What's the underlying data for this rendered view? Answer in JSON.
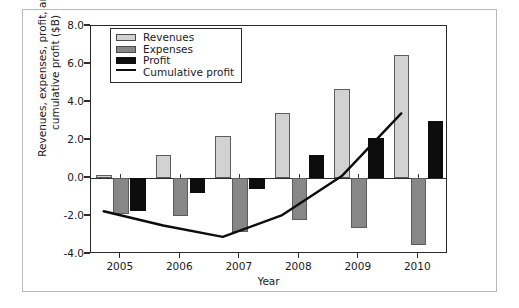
{
  "chart_data": {
    "type": "bar",
    "title": "",
    "subtitle": "",
    "xlabel": "Year",
    "ylabel": "Revenues, expenses, profit, and cumulative profit ($B)",
    "categories": [
      "2005",
      "2006",
      "2007",
      "2008",
      "2009",
      "2010"
    ],
    "ylim": [
      -4.0,
      8.0
    ],
    "yticks": [
      "8.0",
      "6.0",
      "4.0",
      "2.0",
      "0.0",
      "-2.0",
      "-4.0"
    ],
    "ytick_values": [
      8.0,
      6.0,
      4.0,
      2.0,
      0.0,
      -2.0,
      -4.0
    ],
    "grid": false,
    "legend_position": "upper-left-inside",
    "series": [
      {
        "name": "Revenues",
        "kind": "bar",
        "color": "#d2d2d2",
        "values": [
          0.15,
          1.2,
          2.2,
          3.4,
          4.7,
          6.5
        ]
      },
      {
        "name": "Expenses",
        "kind": "bar",
        "color": "#878787",
        "values": [
          -1.9,
          -2.0,
          -2.85,
          -2.2,
          -2.65,
          -3.5
        ]
      },
      {
        "name": "Profit",
        "kind": "bar",
        "color": "#0d0d0d",
        "values": [
          -1.75,
          -0.8,
          -0.6,
          1.2,
          2.1,
          3.0
        ]
      },
      {
        "name": "Cumulative profit",
        "kind": "line",
        "color": "#0d0d0d",
        "values": [
          -1.75,
          -2.5,
          -3.1,
          -1.95,
          0.1,
          3.4
        ]
      }
    ]
  },
  "legend": {
    "items": [
      {
        "label": "Revenues",
        "swatch": "revenues"
      },
      {
        "label": "Expenses",
        "swatch": "expenses"
      },
      {
        "label": "Profit",
        "swatch": "profit"
      },
      {
        "label": "Cumulative profit",
        "swatch": "line"
      }
    ]
  }
}
